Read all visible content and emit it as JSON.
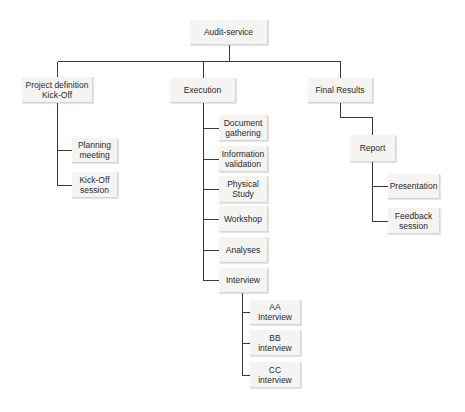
{
  "diagram": {
    "type": "hierarchy",
    "line_color": "#3a3a3a",
    "node_fill": "#f4f4f2",
    "nodes": {
      "root": {
        "label": "Audit-service",
        "x": 190,
        "y": 20,
        "w": 78,
        "h": 25
      },
      "project_definition": {
        "label": "Project definition\nKick-Off",
        "x": 22,
        "y": 77,
        "w": 71,
        "h": 26
      },
      "planning_meeting": {
        "label": "Planning\nmeeting",
        "x": 72,
        "y": 138,
        "w": 46,
        "h": 25
      },
      "kickoff_session": {
        "label": "Kick-Off\nsession",
        "x": 72,
        "y": 172,
        "w": 46,
        "h": 26
      },
      "execution": {
        "label": "Execution",
        "x": 170,
        "y": 78,
        "w": 66,
        "h": 25
      },
      "document_gathering": {
        "label": "Document\ngathering",
        "x": 219,
        "y": 115,
        "w": 49,
        "h": 26
      },
      "information_validation": {
        "label": "Information\nvalidation",
        "x": 219,
        "y": 146,
        "w": 49,
        "h": 26
      },
      "physical_study": {
        "label": "Physical\nStudy",
        "x": 219,
        "y": 176,
        "w": 49,
        "h": 27
      },
      "workshop": {
        "label": "Workshop",
        "x": 219,
        "y": 206,
        "w": 49,
        "h": 26
      },
      "analyses": {
        "label": "Analyses",
        "x": 219,
        "y": 237,
        "w": 49,
        "h": 26
      },
      "interview": {
        "label": "Interview",
        "x": 219,
        "y": 268,
        "w": 49,
        "h": 25
      },
      "aa_interview": {
        "label": "AA Interview",
        "x": 250,
        "y": 300,
        "w": 51,
        "h": 25
      },
      "bb_interview": {
        "label": "BB interview",
        "x": 250,
        "y": 330,
        "w": 51,
        "h": 26
      },
      "cc_interview": {
        "label": "CC interview",
        "x": 250,
        "y": 362,
        "w": 51,
        "h": 26
      },
      "final_results": {
        "label": "Final Results",
        "x": 308,
        "y": 78,
        "w": 65,
        "h": 25
      },
      "report": {
        "label": "Report",
        "x": 350,
        "y": 135,
        "w": 46,
        "h": 27
      },
      "presentation": {
        "label": "Presentation",
        "x": 388,
        "y": 174,
        "w": 52,
        "h": 25
      },
      "feedback_session": {
        "label": "Feedback\nsession",
        "x": 388,
        "y": 208,
        "w": 52,
        "h": 26
      }
    },
    "edges": [
      [
        "root",
        "project_definition"
      ],
      [
        "root",
        "execution"
      ],
      [
        "root",
        "final_results"
      ],
      [
        "project_definition",
        "planning_meeting"
      ],
      [
        "project_definition",
        "kickoff_session"
      ],
      [
        "execution",
        "document_gathering"
      ],
      [
        "execution",
        "information_validation"
      ],
      [
        "execution",
        "physical_study"
      ],
      [
        "execution",
        "workshop"
      ],
      [
        "execution",
        "analyses"
      ],
      [
        "execution",
        "interview"
      ],
      [
        "interview",
        "aa_interview"
      ],
      [
        "interview",
        "bb_interview"
      ],
      [
        "interview",
        "cc_interview"
      ],
      [
        "final_results",
        "report"
      ],
      [
        "report",
        "presentation"
      ],
      [
        "report",
        "feedback_session"
      ]
    ]
  }
}
